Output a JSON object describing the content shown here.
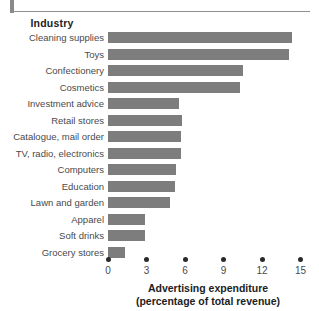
{
  "header": {
    "column_title": "Industry",
    "clipped_title": ""
  },
  "axis": {
    "title_line1": "Advertising expenditure",
    "title_line2": "(percentage of total revenue)",
    "ticks": [
      "0",
      "3",
      "6",
      "9",
      "12",
      "15"
    ]
  },
  "colors": {
    "bar": "#7d7d7d",
    "rule": "#8e8e8e",
    "text": "#4a4a4a",
    "bold_text": "#1d1d1d"
  },
  "chart_data": {
    "type": "bar",
    "orientation": "horizontal",
    "title": "",
    "xlabel": "Advertising expenditure (percentage of total revenue)",
    "ylabel": "Industry",
    "xlim": [
      0,
      15.5
    ],
    "xticks": [
      0,
      3,
      6,
      9,
      12,
      15
    ],
    "grid": false,
    "legend": "none",
    "categories": [
      "Cleaning supplies",
      "Toys",
      "Confectionery",
      "Cosmetics",
      "Investment advice",
      "Retail stores",
      "Catalogue, mail order",
      "TV, radio, electronics",
      "Computers",
      "Education",
      "Lawn and garden",
      "Apparel",
      "Soft drinks",
      "Grocery stores"
    ],
    "values": [
      14.3,
      14.1,
      10.5,
      10.3,
      5.5,
      5.8,
      5.7,
      5.7,
      5.3,
      5.2,
      4.8,
      2.9,
      2.9,
      1.3
    ]
  }
}
